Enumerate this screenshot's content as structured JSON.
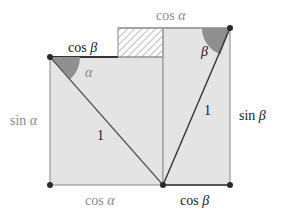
{
  "diagram": {
    "colors": {
      "fill": "#e4e4e4",
      "edge": "#9a9a9a",
      "dark_line": "#333333",
      "angle_fill": "#8f8f8f",
      "dot": "#2a2a2a",
      "hatch": "#8a8a8a",
      "dark_text": "#1a1a1a",
      "light_text": "#8a8a8a"
    },
    "labels": {
      "top_left_segment": {
        "fn": "cos",
        "arg": "β"
      },
      "top_right_segment": {
        "fn": "cos",
        "arg": "α"
      },
      "left_side": {
        "fn": "sin",
        "arg": "α"
      },
      "right_side": {
        "fn": "sin",
        "arg": "β"
      },
      "bottom_left": {
        "fn": "cos",
        "arg": "α"
      },
      "bottom_right": {
        "fn": "cos",
        "arg": "β"
      },
      "hyp_left": "1",
      "hyp_right": "1",
      "angle_alpha": "α",
      "angle_beta": "β"
    },
    "points": {
      "top_left": [
        50,
        57
      ],
      "bottom_left": [
        50,
        185
      ],
      "bottom_mid": [
        163,
        185
      ],
      "bottom_right": [
        230,
        185
      ],
      "top_right": [
        230,
        28
      ]
    },
    "hatched_rect": {
      "x": 118,
      "y": 28,
      "w": 45,
      "h": 29
    }
  }
}
